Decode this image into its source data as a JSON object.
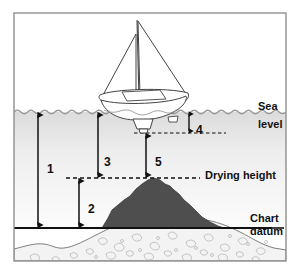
{
  "figure": {
    "title_alt": "Tidal datum diagram showing sea level, drying height and chart datum",
    "labels": {
      "sea_level_line1": "Sea",
      "sea_level_line2": "level",
      "drying_height": "Drying height",
      "chart_datum_line1": "Chart",
      "chart_datum_line2": "datum"
    },
    "callouts": [
      {
        "id": "1",
        "label": "1",
        "meaning": "Charted depth (sea level to chart datum)",
        "x": 47,
        "y": 163
      },
      {
        "id": "2",
        "label": "2",
        "meaning": "Drying height above chart datum",
        "x": 88,
        "y": 203
      },
      {
        "id": "3",
        "label": "3",
        "meaning": "Height of tide above drying height",
        "x": 104,
        "y": 156
      },
      {
        "id": "4",
        "label": "4",
        "meaning": "Vessel draught below sea level",
        "x": 196,
        "y": 124
      },
      {
        "id": "5",
        "label": "5",
        "meaning": "Clearance under the keel",
        "x": 155,
        "y": 156
      }
    ],
    "reference_lines": [
      {
        "name": "sea-level-line",
        "style": "wavy",
        "y": 112
      },
      {
        "name": "drying-height-line",
        "style": "dashed",
        "y": 178
      },
      {
        "name": "chart-datum-line",
        "style": "solid",
        "y": 228
      },
      {
        "name": "keel-depth-line",
        "style": "dashed",
        "y": 133
      }
    ],
    "objects": [
      {
        "name": "sailboat",
        "kind": "vessel"
      },
      {
        "name": "rock",
        "kind": "seabed-feature"
      },
      {
        "name": "seabed",
        "kind": "stippled-ground"
      }
    ],
    "colors": {
      "border": "#8a8a8a",
      "water_top": "#e2e2e2",
      "water_bottom": "#fcfcfc",
      "rock": "#4a4a4a",
      "seabed": "#f2f2f2",
      "line": "#111111",
      "text": "#111111"
    }
  }
}
